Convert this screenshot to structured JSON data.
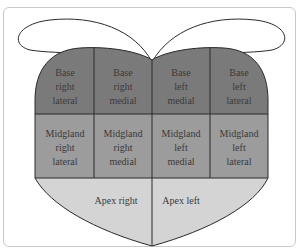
{
  "diagram": {
    "colors": {
      "base": "#7a7a7a",
      "midgland": "#9c9c9c",
      "apex": "#d4d4d4",
      "lobes": "#ffffff",
      "stroke": "#2a2a2a",
      "frame": "#c8c8c8"
    },
    "rows": {
      "base": [
        {
          "line1": "Base",
          "line2": "right",
          "line3": "lateral"
        },
        {
          "line1": "Base",
          "line2": "right",
          "line3": "medial"
        },
        {
          "line1": "Base",
          "line2": "left",
          "line3": "medial"
        },
        {
          "line1": "Base",
          "line2": "left",
          "line3": "lateral"
        }
      ],
      "midgland": [
        {
          "line1": "Midgland",
          "line2": "right",
          "line3": "lateral"
        },
        {
          "line1": "Midgland",
          "line2": "right",
          "line3": "medial"
        },
        {
          "line1": "Midgland",
          "line2": "left",
          "line3": "medial"
        },
        {
          "line1": "Midgland",
          "line2": "left",
          "line3": "lateral"
        }
      ],
      "apex": [
        {
          "label": "Apex right"
        },
        {
          "label": "Apex left"
        }
      ]
    }
  }
}
